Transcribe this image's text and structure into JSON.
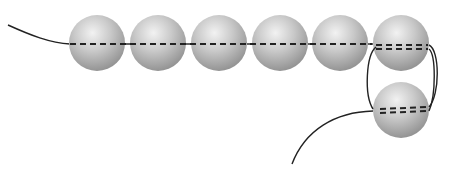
{
  "diagram": {
    "bead_color": "#b8b8b8",
    "thread_color": "#222222",
    "bead_radius": 28,
    "beads": [
      {
        "id": "bead-1",
        "cx": 97,
        "cy": 43
      },
      {
        "id": "bead-2",
        "cx": 158,
        "cy": 43
      },
      {
        "id": "bead-3",
        "cx": 219,
        "cy": 43
      },
      {
        "id": "bead-4",
        "cx": 280,
        "cy": 43
      },
      {
        "id": "bead-5",
        "cx": 340,
        "cy": 43
      },
      {
        "id": "bead-6",
        "cx": 401,
        "cy": 43
      },
      {
        "id": "bead-7",
        "cx": 401,
        "cy": 110
      }
    ],
    "labels": {
      "title": "Thread path through beads"
    }
  }
}
